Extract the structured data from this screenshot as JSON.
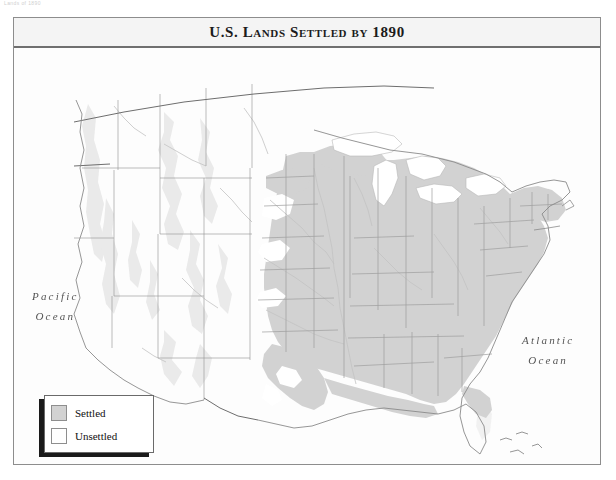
{
  "top_caption": "Lands of 1890",
  "map": {
    "title": "U.S. Lands Settled by 1890",
    "ocean_labels": [
      {
        "name": "pacific",
        "line1": "Pacific",
        "line2": "Ocean"
      },
      {
        "name": "atlantic",
        "line1": "Atlantic",
        "line2": "Ocean"
      }
    ]
  },
  "legend": {
    "items": [
      {
        "label": "Settled",
        "color": "#d2d2d2"
      },
      {
        "label": "Unsettled",
        "color": "#ffffff"
      }
    ]
  },
  "colors": {
    "settled_fill": "#d2d2d2",
    "unsettled_fill": "#ffffff",
    "state_border": "#9a9a9a",
    "national_border": "#6a6a6a",
    "coastline": "#8a8a8a",
    "river": "#bdbdbd",
    "terrain_shade": "#e6e6e6",
    "frame_border": "#8d8d8d",
    "title_rule": "#6f6f6f"
  }
}
